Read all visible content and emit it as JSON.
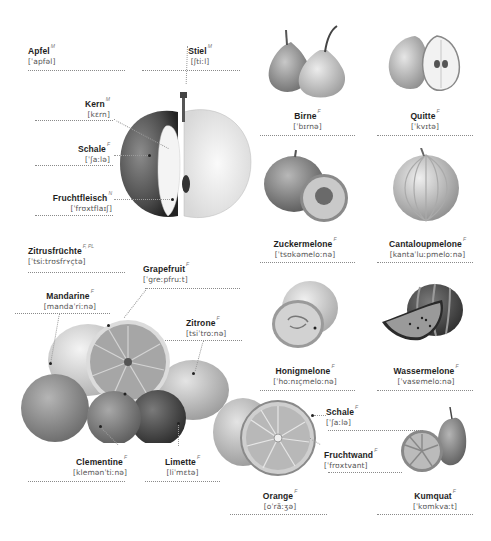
{
  "apple": {
    "title": {
      "word": "Apfel",
      "gender": "M",
      "ipa": "[ˈapfəl]"
    },
    "parts": [
      {
        "word": "Stiel",
        "gender": "M",
        "ipa": "[ʃtiːl]"
      },
      {
        "word": "Kern",
        "gender": "M",
        "ipa": "[kɛrn]"
      },
      {
        "word": "Schale",
        "gender": "F",
        "ipa": "[ˈʃaːlə]"
      },
      {
        "word": "Fruchtfleisch",
        "gender": "N",
        "ipa": "[ˈfrʊxtflaɪʃ]"
      }
    ]
  },
  "fruits": [
    {
      "word": "Birne",
      "gender": "F",
      "ipa": "[ˈbɪrnə]"
    },
    {
      "word": "Quitte",
      "gender": "F",
      "ipa": "[ˈkvɪtə]"
    },
    {
      "word": "Zuckermelone",
      "gender": "F",
      "ipa": "[ˈtsʊkəmeloːnə]"
    },
    {
      "word": "Cantaloupmelone",
      "gender": "F",
      "ipa": "[kantaˈluːpmeloːnə]"
    },
    {
      "word": "Honigmelone",
      "gender": "F",
      "ipa": "[ˈhoːnɪçmeloːnə]"
    },
    {
      "word": "Wassermelone",
      "gender": "F",
      "ipa": "[ˈvasɐmeloːnə]"
    }
  ],
  "citrus": {
    "title": {
      "word": "Zitrusfrüchte",
      "gender": "F, PL",
      "ipa": "[ˈtsiːtrʊsfrʏçtə]"
    },
    "items": [
      {
        "word": "Grapefruit",
        "gender": "F",
        "ipa": "[ˈgreːpfruːt]"
      },
      {
        "word": "Mandarine",
        "gender": "F",
        "ipa": "[mandaˈriːnə]"
      },
      {
        "word": "Zitrone",
        "gender": "F",
        "ipa": "[tsiˈtroːnə]"
      },
      {
        "word": "Clementine",
        "gender": "F",
        "ipa": "[klemənˈtiːnə]"
      },
      {
        "word": "Limette",
        "gender": "F",
        "ipa": "[liˈmɛtə]"
      }
    ]
  },
  "orange": {
    "title": {
      "word": "Orange",
      "gender": "F",
      "ipa": "[oˈrãːʒə]"
    },
    "parts": [
      {
        "word": "Schale",
        "gender": "F",
        "ipa": "[ˈʃaːlə]"
      },
      {
        "word": "Fruchtwand",
        "gender": "F",
        "ipa": "[ˈfrʊxtvant]"
      }
    ]
  },
  "kumquat": {
    "word": "Kumquat",
    "gender": "F",
    "ipa": "[ˈkʊmkvaːt]"
  }
}
